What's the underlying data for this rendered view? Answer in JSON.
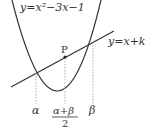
{
  "diagram": {
    "curve_label": "y=x²−3x−1",
    "line_label": "y=x+k",
    "point_label": "P",
    "x_labels": {
      "alpha": "α",
      "midpoint_numerator": "α+β",
      "midpoint_denominator": "2",
      "beta": "β"
    },
    "colors": {
      "stroke": "#333333",
      "dashed": "#999999",
      "background": "#ffffff"
    }
  }
}
